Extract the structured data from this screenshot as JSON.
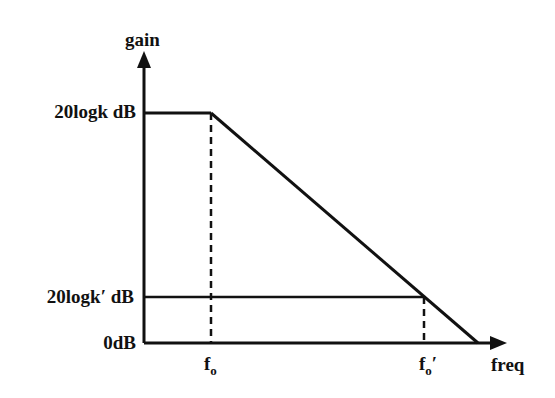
{
  "diagram": {
    "type": "bode-magnitude-asymptote",
    "y_axis_label": "gain",
    "x_axis_label": "freq",
    "levels": [
      {
        "label": "20logk dB",
        "y": 113
      },
      {
        "label": "20logk′ dB",
        "y": 297
      },
      {
        "label": "0dB",
        "y": 343
      }
    ],
    "frequencies": [
      {
        "base": "f",
        "sub": "o",
        "prime": "",
        "x": 211
      },
      {
        "base": "f",
        "sub": "o",
        "prime": "′",
        "x": 424
      }
    ]
  }
}
